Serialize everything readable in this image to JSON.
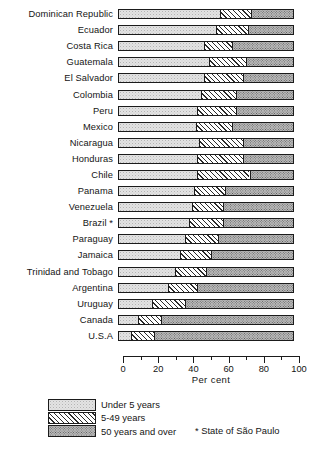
{
  "chart_data": {
    "type": "bar",
    "subtype": "stacked-horizontal-100",
    "title": "",
    "xlabel": "Per cent",
    "ylabel": "",
    "xlim": [
      0,
      100
    ],
    "xticks": [
      0,
      20,
      40,
      60,
      80,
      100
    ],
    "xticklabels": [
      "0",
      "20",
      "40",
      "60",
      "80",
      "100"
    ],
    "minor_tick_interval": 10,
    "grid": false,
    "legend_position": "bottom-left",
    "categories": [
      "Dominican Republic",
      "Ecuador",
      "Costa Rica",
      "Guatemala",
      "El Salvador",
      "Colombia",
      "Peru",
      "Mexico",
      "Nicaragua",
      "Honduras",
      "Chile",
      "Panama",
      "Venezuela",
      "Brazil *",
      "Paraguay",
      "Jamaica",
      "Trinidad and Tobago",
      "Argentina",
      "Uruguay",
      "Canada",
      "U.S.A"
    ],
    "series": [
      {
        "name": "Under 5 years",
        "pattern": "light-stipple",
        "values": [
          58,
          56,
          49,
          52,
          49,
          47,
          45,
          44,
          46,
          45,
          45,
          43,
          42,
          40,
          38,
          35,
          32,
          28,
          19,
          11,
          7
        ]
      },
      {
        "name": "5-49 years",
        "pattern": "diagonal-hatch",
        "values": [
          18,
          18,
          16,
          21,
          22,
          20,
          22,
          21,
          25,
          26,
          30,
          18,
          18,
          20,
          19,
          18,
          18,
          17,
          19,
          13,
          13
        ]
      },
      {
        "name": "50 years and over",
        "pattern": "dark-stipple",
        "values": [
          24,
          26,
          35,
          27,
          29,
          33,
          33,
          35,
          29,
          29,
          25,
          39,
          40,
          40,
          43,
          47,
          50,
          55,
          62,
          76,
          80
        ]
      }
    ],
    "footnote": "* State of São Paulo"
  },
  "legend": {
    "items": [
      {
        "label": "Under 5 years",
        "pattern": "light-stipple"
      },
      {
        "label": "5-49 years",
        "pattern": "diagonal-hatch"
      },
      {
        "label": "50 years and over",
        "pattern": "dark-stipple"
      }
    ]
  },
  "colors": {
    "ink": "#1b1b1b",
    "paper": "#ffffff",
    "under5_fill": "#e3e3e3",
    "mid_fill": "#f2f2f2",
    "over50_fill": "#b9b9b9"
  }
}
